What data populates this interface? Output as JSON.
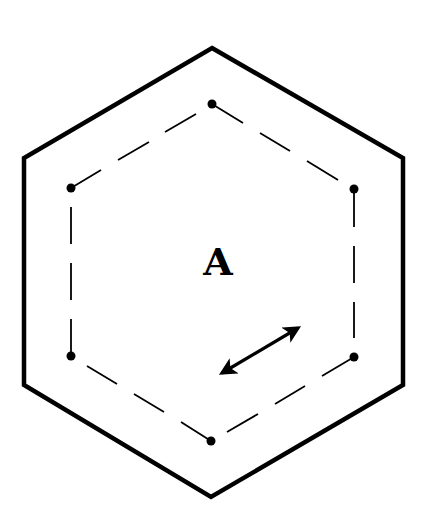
{
  "diagram": {
    "label": "A",
    "colors": {
      "stroke": "#000000",
      "background": "#ffffff"
    },
    "outer_hexagon": {
      "style": "solid",
      "vertices": [
        [
          212,
          48
        ],
        [
          403,
          158
        ],
        [
          403,
          385
        ],
        [
          211,
          497
        ],
        [
          24,
          385
        ],
        [
          24,
          158
        ]
      ]
    },
    "inner_hexagon": {
      "style": "dashed",
      "vertex_markers": "filled-dots",
      "vertices": [
        [
          212,
          104
        ],
        [
          354,
          189
        ],
        [
          354,
          357
        ],
        [
          211,
          441
        ],
        [
          71,
          356
        ],
        [
          71,
          188
        ]
      ]
    },
    "arrow": {
      "type": "double-headed",
      "from": [
        217,
        376
      ],
      "to": [
        303,
        325
      ]
    }
  }
}
